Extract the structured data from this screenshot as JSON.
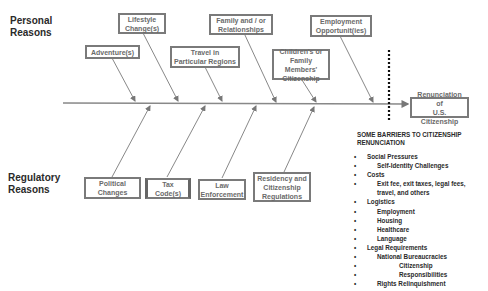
{
  "diagram": {
    "type": "fishbone",
    "effect": "Renunciation of U.S. Citizenship",
    "effect_lines": [
      "Renunciation of",
      "U.S. Citizenship"
    ],
    "categories": {
      "personal": {
        "label_lines": [
          "Personal",
          "Reasons"
        ]
      },
      "regulatory": {
        "label_lines": [
          "Regulatory",
          "Reasons"
        ]
      }
    },
    "personal_causes": [
      {
        "lines": [
          "Adventure(s)"
        ]
      },
      {
        "lines": [
          "Lifestyle",
          "Change(s)"
        ]
      },
      {
        "lines": [
          "Travel in",
          "Particular Regions"
        ]
      },
      {
        "lines": [
          "Family and / or",
          "Relationships"
        ]
      },
      {
        "lines": [
          "Children's or",
          "Family Members'",
          "Citizenship"
        ]
      },
      {
        "lines": [
          "Employment",
          "Opportunit(ies)"
        ]
      }
    ],
    "regulatory_causes": [
      {
        "lines": [
          "Political",
          "Changes"
        ]
      },
      {
        "lines": [
          "Tax",
          "Code(s)"
        ]
      },
      {
        "lines": [
          "Law",
          "Enforcement"
        ]
      },
      {
        "lines": [
          "Residency and",
          "Citizenship",
          "Regulations"
        ]
      }
    ]
  },
  "barriers": {
    "title_lines": [
      "SOME BARRIERS TO CITIZENSHIP",
      "RENUNCIATION"
    ],
    "items": [
      {
        "level": 0,
        "text": "Social Pressures"
      },
      {
        "level": 1,
        "text": "Self-Identity Challenges"
      },
      {
        "level": 0,
        "text": "Costs"
      },
      {
        "level": 1,
        "text": "Exit fee, exit taxes, legal fees,"
      },
      {
        "level": 1,
        "text": "travel, and others",
        "nobullet": true
      },
      {
        "level": 0,
        "text": "Logistics"
      },
      {
        "level": 1,
        "text": "Employment"
      },
      {
        "level": 1,
        "text": "Housing"
      },
      {
        "level": 1,
        "text": "Healthcare"
      },
      {
        "level": 1,
        "text": "Language"
      },
      {
        "level": 0,
        "text": "Legal Requirements"
      },
      {
        "level": 1,
        "text": "National Bureaucracies"
      },
      {
        "level": 2,
        "text": "Citizenship"
      },
      {
        "level": 2,
        "text": "Responsibilities"
      },
      {
        "level": 1,
        "text": "Rights Relinquishment"
      }
    ]
  }
}
